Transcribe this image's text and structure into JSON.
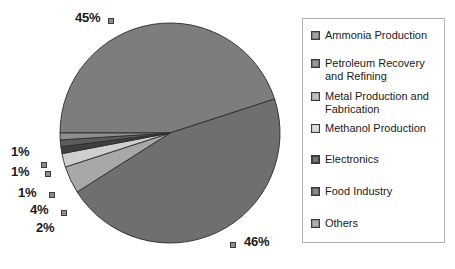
{
  "chart_data": {
    "type": "pie",
    "title": "",
    "legend_position": "right",
    "categories": [
      "Ammonia Production",
      "Petroleum Recovery and Refining",
      "Metal Production and Fabrication",
      "Methanol Production",
      "Electronics",
      "Food Industry",
      "Others"
    ],
    "values": [
      45,
      46,
      4,
      2,
      1,
      1,
      1
    ],
    "value_labels": [
      "45%",
      "46%",
      "4%",
      "2%",
      "1%",
      "1%",
      "1%"
    ],
    "colors": [
      "#7d7d7d",
      "#6f6f6f",
      "#a8a8a8",
      "#cfcfcf",
      "#3f3f3f",
      "#5c5c5c",
      "#8f8f8f"
    ],
    "units": "percent",
    "grid": false
  },
  "legend": {
    "items": [
      {
        "label": "Ammonia Production",
        "color": "#7d7d7d"
      },
      {
        "label": "Petroleum Recovery and Refining",
        "color": "#6f6f6f"
      },
      {
        "label": "Metal Production and Fabrication",
        "color": "#a8a8a8"
      },
      {
        "label": "Methanol Production",
        "color": "#cfcfcf"
      },
      {
        "label": "Electronics",
        "color": "#3f3f3f"
      },
      {
        "label": "Food Industry",
        "color": "#5c5c5c"
      },
      {
        "label": "Others",
        "color": "#8f8f8f"
      }
    ]
  },
  "labels": [
    {
      "text": "45%",
      "id": "label-ammonia"
    },
    {
      "text": "46%",
      "id": "label-petroleum"
    },
    {
      "text": "4%",
      "id": "label-metal"
    },
    {
      "text": "2%",
      "id": "label-methanol"
    },
    {
      "text": "1%",
      "id": "label-electronics"
    },
    {
      "text": "1%",
      "id": "label-food"
    },
    {
      "text": "1%",
      "id": "label-others"
    }
  ]
}
